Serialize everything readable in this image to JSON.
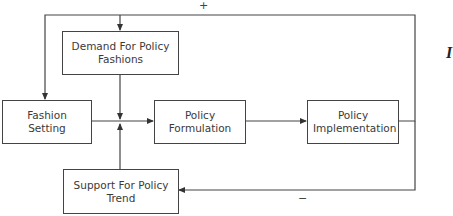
{
  "diagram": {
    "nodes": {
      "demand": "Demand For Policy Fashions",
      "fashion_setting": "Fashion Setting",
      "formulation": "Policy Formulation",
      "implementation": "Policy Implementation",
      "support": "Support For Policy Trend"
    },
    "feedback": {
      "positive_sign": "+",
      "negative_sign": "−"
    },
    "side_mark": "I",
    "edges": [
      {
        "from": "implementation",
        "to": "demand",
        "sign": "+"
      },
      {
        "from": "implementation",
        "to": "fashion_setting",
        "sign": "+"
      },
      {
        "from": "implementation",
        "to": "support",
        "sign": "−"
      },
      {
        "from": "demand",
        "to": "formulation"
      },
      {
        "from": "fashion_setting",
        "to": "formulation"
      },
      {
        "from": "support",
        "to": "formulation"
      },
      {
        "from": "formulation",
        "to": "implementation"
      }
    ]
  }
}
